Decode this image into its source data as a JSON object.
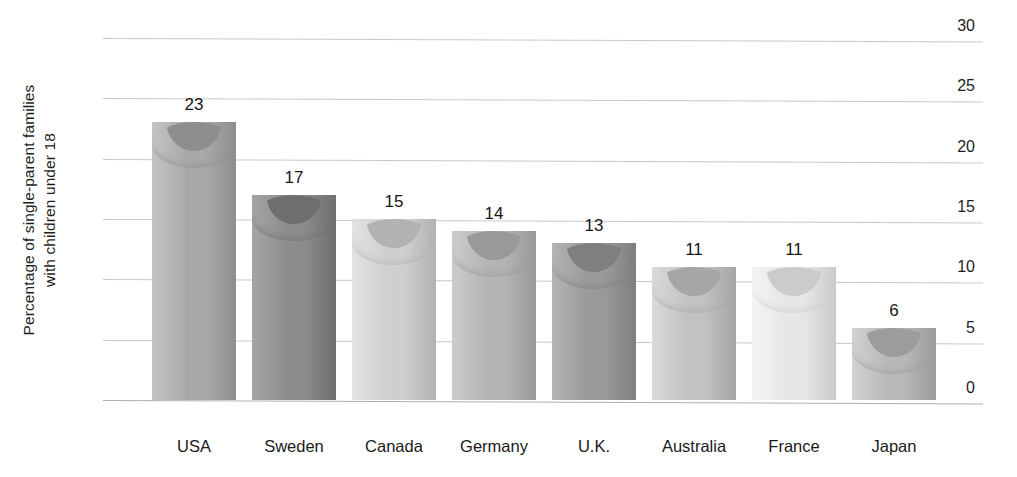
{
  "chart_data": {
    "type": "bar",
    "title": "",
    "xlabel": "",
    "ylabel": "Percentage of single-parent families with children under 18",
    "ylabel_line1": "Percentage of single-parent families",
    "ylabel_line2": "with children under 18",
    "categories": [
      "USA",
      "Sweden",
      "Canada",
      "Germany",
      "U.K.",
      "Australia",
      "France",
      "Japan"
    ],
    "values": [
      23,
      17,
      15,
      14,
      13,
      11,
      11,
      6
    ],
    "value_labels": [
      "23",
      "17",
      "15",
      "14",
      "13",
      "11",
      "11",
      "6"
    ],
    "ylim": [
      0,
      30
    ],
    "yticks": [
      0,
      5,
      10,
      15,
      20,
      25,
      30
    ],
    "ytick_labels": [
      "0",
      "5",
      "10",
      "15",
      "20",
      "25",
      "30"
    ],
    "grid": true,
    "legend": false,
    "legend_position": "none",
    "bar_style": "3d-cylinder",
    "bar_colors": [
      "#a9a9a9",
      "#8c8c8c",
      "#cfcfcf",
      "#b4b4b4",
      "#9a9a9a",
      "#c2c2c2",
      "#e6e6e6",
      "#b8b8b8"
    ],
    "bar_colors_dark": [
      "#8e8e8e",
      "#6f6f6f",
      "#b2b2b2",
      "#999999",
      "#7f7f7f",
      "#a6a6a6",
      "#cbcbcb",
      "#9c9c9c"
    ],
    "bar_colors_light": [
      "#c4c4c4",
      "#a5a5a5",
      "#e2e2e2",
      "#cccccc",
      "#b4b4b4",
      "#dadada",
      "#f4f4f4",
      "#d2d2d2"
    ],
    "grid_color": "#c9c9c9",
    "axis_color": "#b0b0b0",
    "background": "#ffffff",
    "text_color": "#1a1a1a"
  }
}
